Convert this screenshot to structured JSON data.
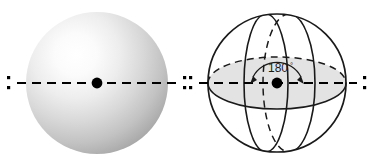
{
  "figure": {
    "background_color": "#ffffff",
    "panels": [
      {
        "id": "left-panel",
        "name": "shaded-sphere-panel",
        "kind": "shaded-sphere",
        "center_x": 97,
        "center_y": 83,
        "radius": 71,
        "fill_light": "#fdfdfd",
        "fill_mid": "#c9c9c9",
        "fill_dark": "#9a9a9a",
        "highlight_x": 72,
        "highlight_y": 48,
        "axis": {
          "name": "rotation-axis",
          "stroke": "#000000",
          "stroke_width": 2.2,
          "dash": "9 6",
          "y": 83,
          "x_start": 17,
          "x_end": 177
        },
        "center_dot": {
          "name": "center-point",
          "x": 97,
          "y": 83,
          "radius": 5.4,
          "fill": "#000000"
        },
        "end_markers": [
          {
            "name": "axis-end-marker-left",
            "x": 9,
            "y": 83
          },
          {
            "name": "axis-end-marker-right",
            "x": 185,
            "y": 83
          }
        ]
      },
      {
        "id": "right-panel",
        "name": "wireframe-sphere-panel",
        "kind": "wireframe-sphere",
        "center_x": 277,
        "center_y": 83,
        "radius": 69,
        "outline_stroke": "#1a1a1a",
        "outline_stroke_width": 1.6,
        "equator_fill": "#e3e3e3",
        "equator_rx": 69,
        "equator_ry": 26,
        "meridian_front_rx": 22,
        "meridian_back_rx": 26,
        "axis": {
          "name": "rotation-axis",
          "stroke": "#000000",
          "stroke_width": 2.2,
          "dash": "9 6",
          "y": 83,
          "x_start": 199,
          "x_end": 357
        },
        "center_dot": {
          "name": "center-point",
          "x": 277,
          "y": 83,
          "radius": 5.4,
          "fill": "#000000"
        },
        "end_markers": [
          {
            "name": "axis-end-marker-left",
            "x": 191,
            "y": 83
          },
          {
            "name": "axis-end-marker-right",
            "x": 365,
            "y": 83
          }
        ],
        "angle_annotation": {
          "name": "rotation-angle-label",
          "value": "180",
          "degree_symbol": "°",
          "label_x": 277,
          "label_y": 72,
          "arc_radius": 27,
          "arc_stroke": "#1a1a1a",
          "arrowheads": 2
        }
      }
    ]
  },
  "colors": {
    "ink": "#1a1a1a",
    "axis": "#000000",
    "equator_fill": "#e3e3e3",
    "sphere_light": "#fdfdfd",
    "sphere_dark": "#969696",
    "page": "#ffffff"
  }
}
